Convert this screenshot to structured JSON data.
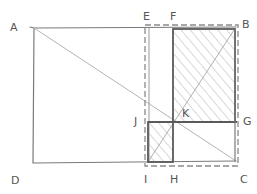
{
  "diagram": {
    "type": "geometric construction sketch",
    "style": "hand-drawn pencil",
    "colors": {
      "background": "#ffffff",
      "stroke": "#6e6e6e",
      "bold_stroke": "#5a5a5a",
      "light_stroke": "#b0b0b0",
      "hatch": "#b8b8b8"
    },
    "points": {
      "A": {
        "label": "A",
        "x": 34,
        "y": 28,
        "lx": 10,
        "ly": 22
      },
      "B": {
        "label": "B",
        "x": 236,
        "y": 28,
        "lx": 242,
        "ly": 19
      },
      "C": {
        "label": "C",
        "x": 236,
        "y": 162,
        "lx": 240,
        "ly": 174
      },
      "D": {
        "label": "D",
        "x": 34,
        "y": 162,
        "lx": 11,
        "ly": 175
      },
      "E": {
        "label": "E",
        "x": 148,
        "y": 28,
        "lx": 143,
        "ly": 11
      },
      "F": {
        "label": "F",
        "x": 173,
        "y": 28,
        "lx": 170,
        "ly": 11
      },
      "G": {
        "label": "G",
        "x": 236,
        "y": 122,
        "lx": 243,
        "ly": 116
      },
      "H": {
        "label": "H",
        "x": 173,
        "y": 162,
        "lx": 170,
        "ly": 174
      },
      "I": {
        "label": "I",
        "x": 148,
        "y": 162,
        "lx": 144,
        "ly": 174
      },
      "J": {
        "label": "J",
        "x": 148,
        "y": 122,
        "lx": 134,
        "ly": 116
      },
      "K": {
        "label": "K",
        "x": 173,
        "y": 122,
        "lx": 182,
        "ly": 108
      }
    },
    "shapes": [
      {
        "name": "outer-rectangle-ABCD",
        "vertices": [
          "A",
          "B",
          "C",
          "D"
        ],
        "stroke": "solid"
      },
      {
        "name": "dashed-rectangle-EBCI",
        "vertices": [
          "E",
          "B",
          "C",
          "I"
        ],
        "stroke": "dashed"
      },
      {
        "name": "hatched-rectangle-FBGK",
        "vertices": [
          "F",
          "B",
          "G",
          "K"
        ],
        "stroke": "bold",
        "fill": "hatched"
      },
      {
        "name": "hatched-rectangle-JKHI",
        "vertices": [
          "J",
          "K",
          "H",
          "I"
        ],
        "stroke": "bold",
        "fill": "hatched"
      },
      {
        "name": "diagonal-AC",
        "from": "A",
        "to": "C",
        "stroke": "light"
      },
      {
        "name": "diagonal-IB",
        "from": "I",
        "to": "B",
        "stroke": "light"
      }
    ]
  }
}
